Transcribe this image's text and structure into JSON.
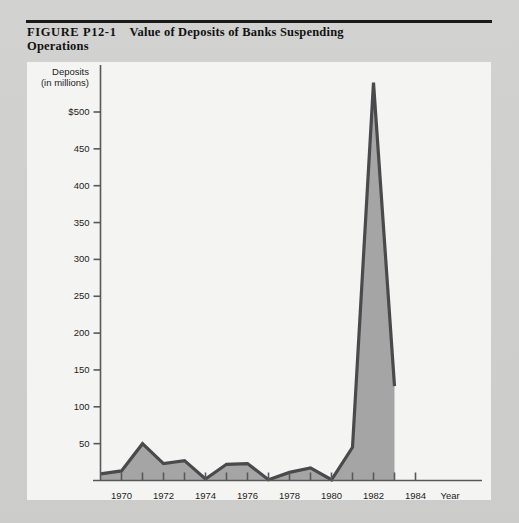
{
  "figure": {
    "number": "FIGURE P12-1",
    "title_line1": "Value of Deposits of Banks Suspending",
    "title_line2": "Operations"
  },
  "chart_data": {
    "type": "area",
    "title": "Value of Deposits of Banks Suspending Operations",
    "subtitle": "",
    "xlabel": "Year",
    "ylabel": "Deposits (in millions)",
    "ylabel_line1": "Deposits",
    "ylabel_line2": "(in millions)",
    "y_axis_title": "Deposits (in millions)",
    "x_axis_title": "Year",
    "ylim": [
      0,
      550
    ],
    "xlim": [
      1969,
      1985
    ],
    "grid": false,
    "legend": null,
    "y_ticks": [
      50,
      100,
      150,
      200,
      250,
      300,
      350,
      400,
      450,
      500
    ],
    "y_tick_labels": [
      "50",
      "100",
      "150",
      "200",
      "250",
      "300",
      "350",
      "400",
      "450",
      "$500"
    ],
    "x_ticks": [
      1970,
      1971,
      1972,
      1973,
      1974,
      1975,
      1976,
      1977,
      1978,
      1979,
      1980,
      1981,
      1982,
      1983,
      1984
    ],
    "x_tick_labels": [
      "1970",
      "",
      "1972",
      "",
      "1974",
      "",
      "1976",
      "",
      "1978",
      "",
      "1980",
      "",
      "1982",
      "",
      "1984"
    ],
    "x_visible_labels": [
      "1970",
      "1972",
      "1974",
      "1976",
      "1978",
      "1980",
      "1982",
      "1984"
    ],
    "series_name": "Deposits of suspended banks",
    "x": [
      1969,
      1970,
      1971,
      1972,
      1973,
      1974,
      1975,
      1976,
      1977,
      1978,
      1979,
      1980,
      1981,
      1982,
      1983
    ],
    "values": [
      9,
      13,
      50,
      23,
      27,
      2,
      22,
      23,
      1,
      11,
      17,
      1,
      45,
      540,
      128
    ],
    "fill_color": "#a5a5a5",
    "line_color": "#4a4a4c",
    "plot_background": "#f4f4f2"
  },
  "colors": {
    "page_background": "#d0d0cf",
    "card_background": "#f4f4f2",
    "rule": "#1a1a1a",
    "axis": "#58585a",
    "text": "#1d1d1d",
    "area_fill": "#a5a5a5",
    "area_stroke": "#4a4a4c"
  }
}
